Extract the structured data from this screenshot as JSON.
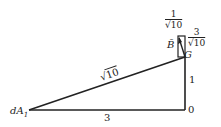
{
  "diagram": {
    "labels": {
      "source": "dA",
      "source_sub": "1",
      "origin": "0",
      "point_g": "G",
      "vector_b": "B̄",
      "hypotenuse": "√10",
      "horizontal_side": "3",
      "vertical_side": "1"
    },
    "fractions": {
      "top": {
        "numerator": "1",
        "denominator_radical": "√",
        "denominator_value": "10"
      },
      "right": {
        "numerator": "3",
        "denominator_radical": "√",
        "denominator_value": "10"
      }
    },
    "colors": {
      "stroke": "#222222",
      "background": "#ffffff"
    }
  }
}
